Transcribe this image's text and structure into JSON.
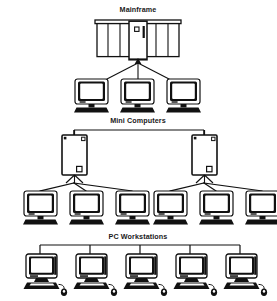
{
  "diagram": {
    "background_color": "#ffffff",
    "ink_color": "#111111",
    "width": 277,
    "height": 301,
    "tiers": [
      {
        "id": "mainframe",
        "label": "Mainframe",
        "label_x": 138,
        "label_y": 12,
        "host_type": "mainframe-cabinet",
        "host_count": 1,
        "client_type": "terminal",
        "client_count": 3,
        "link_style": "star",
        "clients": [
          {
            "label": "terminal",
            "x": 92,
            "y": 79
          },
          {
            "label": "terminal",
            "x": 138,
            "y": 79
          },
          {
            "label": "terminal",
            "x": 184,
            "y": 79
          }
        ]
      },
      {
        "id": "mini-computers",
        "label": "Mini Computers",
        "label_x": 138,
        "label_y": 123,
        "host_type": "mini-tower",
        "host_count": 2,
        "client_type": "terminal",
        "client_count": 6,
        "link_style": "bus-and-star",
        "hosts": [
          {
            "label": "mini-computer",
            "x": 62,
            "y": 135
          },
          {
            "label": "mini-computer",
            "x": 192,
            "y": 135
          }
        ],
        "clients": [
          {
            "label": "terminal",
            "x": 24,
            "y": 188
          },
          {
            "label": "terminal",
            "x": 70,
            "y": 188
          },
          {
            "label": "terminal",
            "x": 116,
            "y": 188
          },
          {
            "label": "terminal",
            "x": 154,
            "y": 188
          },
          {
            "label": "terminal",
            "x": 200,
            "y": 188
          },
          {
            "label": "terminal",
            "x": 246,
            "y": 188
          }
        ]
      },
      {
        "id": "pc-workstations",
        "label": "PC Workstations",
        "label_x": 138,
        "label_y": 239,
        "host_type": "none",
        "host_count": 0,
        "client_type": "pc-workstation",
        "client_count": 5,
        "link_style": "bus",
        "clients": [
          {
            "label": "pc-workstation",
            "x": 38,
            "y": 254
          },
          {
            "label": "pc-workstation",
            "x": 88,
            "y": 254
          },
          {
            "label": "pc-workstation",
            "x": 138,
            "y": 254
          },
          {
            "label": "pc-workstation",
            "x": 188,
            "y": 254
          },
          {
            "label": "pc-workstation",
            "x": 238,
            "y": 254
          }
        ]
      }
    ],
    "icons": {
      "mainframe": "mainframe-cabinet-icon",
      "mini": "mini-computer-icon",
      "terminal": "terminal-icon",
      "pc": "pc-workstation-icon",
      "mouse": "mouse-icon",
      "keyboard": "keyboard-icon"
    }
  }
}
